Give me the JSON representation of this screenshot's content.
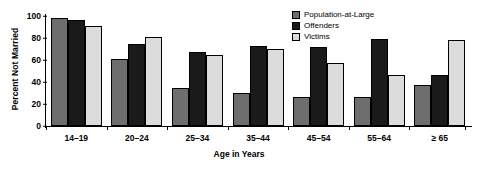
{
  "chart_data": {
    "type": "bar",
    "title": "",
    "xlabel": "Age in Years",
    "ylabel": "Percent Not Married",
    "categories": [
      "14–19",
      "20–24",
      "25–34",
      "35–44",
      "45–54",
      "55–64",
      "≥ 65"
    ],
    "series": [
      {
        "name": "Population-at-Large",
        "color": "#6e6e6e",
        "values": [
          98,
          61,
          35,
          30,
          26,
          26,
          37
        ]
      },
      {
        "name": "Offenders",
        "color": "#1a1a1a",
        "values": [
          96,
          75,
          67,
          73,
          72,
          79,
          46
        ]
      },
      {
        "name": "Victims",
        "color": "#dcdcdc",
        "values": [
          91,
          81,
          65,
          70,
          57,
          46,
          78
        ]
      }
    ],
    "ylim": [
      0,
      100
    ],
    "yticks": [
      0,
      20,
      40,
      60,
      80,
      100
    ],
    "grid": false,
    "legend_position": "top-right"
  },
  "legend": {
    "items": [
      {
        "label": "Population-at-Large"
      },
      {
        "label": "Offenders"
      },
      {
        "label": "Victims"
      }
    ]
  }
}
